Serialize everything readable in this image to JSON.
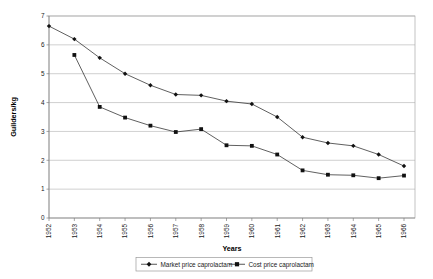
{
  "chart_data": {
    "type": "line",
    "title": "",
    "xlabel": "Years",
    "ylabel": "Guilders/kg",
    "grid": true,
    "legend_position": "bottom",
    "ylim": [
      0,
      7
    ],
    "yticks": [
      "0",
      "1",
      "2",
      "3",
      "4",
      "5",
      "6",
      "7"
    ],
    "categories": [
      "1952",
      "1953",
      "1954",
      "1955",
      "1956",
      "1957",
      "1958",
      "1959",
      "1960",
      "1961",
      "1962",
      "1963",
      "1964",
      "1965",
      "1966"
    ],
    "series": [
      {
        "name": "Market price caprolactam",
        "marker": "diamond",
        "color": "#111111",
        "values": [
          6.65,
          6.2,
          5.55,
          5.0,
          4.6,
          4.28,
          4.25,
          4.05,
          3.95,
          3.5,
          2.8,
          2.6,
          2.5,
          2.2,
          1.8
        ]
      },
      {
        "name": "Cost price caprolactam",
        "marker": "square",
        "color": "#111111",
        "values": [
          null,
          5.65,
          3.85,
          3.48,
          3.2,
          2.98,
          3.08,
          2.52,
          2.5,
          2.2,
          1.65,
          1.5,
          1.48,
          1.38,
          1.47
        ]
      }
    ]
  },
  "legend": {
    "entries": [
      {
        "label": "Market price caprolactam"
      },
      {
        "label": "Cost price caprolactam"
      }
    ]
  },
  "axes": {
    "x_title": "Years",
    "y_title": "Guilders/kg"
  }
}
